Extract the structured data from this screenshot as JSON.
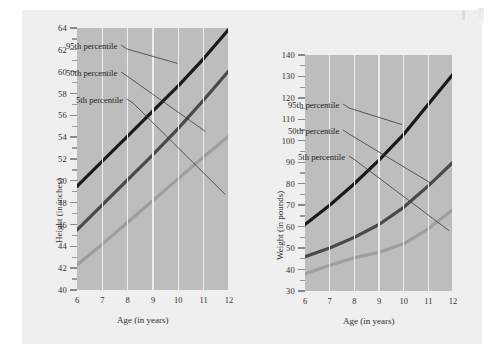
{
  "page": {
    "background": "#ffffff",
    "card_background": "#efefef",
    "plot_background": "#bdbdbd",
    "gridline_color": "#ededed"
  },
  "colors": {
    "p95": "#1a1a1a",
    "p50": "#4a4a4a",
    "p05": "#9e9e9e",
    "text": "#2f2c2a"
  },
  "charts": [
    {
      "id": "height-chart",
      "chart_data": {
        "type": "line",
        "title": "",
        "xlabel": "Age (in years)",
        "ylabel": "Height (in inches)",
        "x": [
          6,
          7,
          8,
          9,
          10,
          11,
          12
        ],
        "xlim": [
          6,
          12
        ],
        "ylim": [
          40,
          64
        ],
        "xticks": [
          "6",
          "7",
          "8",
          "9",
          "10",
          "11",
          "12"
        ],
        "yticks": [
          "40",
          "42",
          "44",
          "46",
          "48",
          "50",
          "52",
          "54",
          "56",
          "58",
          "60",
          "62",
          "64"
        ],
        "grid": true,
        "legend": "inline-annotations",
        "series": [
          {
            "name": "95th percentile",
            "color": "#1a1a1a",
            "values": [
              49.5,
              51.8,
              54.1,
              56.4,
              58.7,
              61.2,
              63.9
            ]
          },
          {
            "name": "50th percentile",
            "color": "#4a4a4a",
            "values": [
              45.5,
              47.8,
              50.1,
              52.4,
              54.8,
              57.4,
              60.1
            ]
          },
          {
            "name": "5th percentile",
            "color": "#9e9e9e",
            "values": [
              42.3,
              44.2,
              46.2,
              48.2,
              50.2,
              52.2,
              54.1
            ]
          }
        ]
      }
    },
    {
      "id": "weight-chart",
      "chart_data": {
        "type": "line",
        "title": "",
        "xlabel": "Age (in years)",
        "ylabel": "Weight (in pounds)",
        "x": [
          6,
          7,
          8,
          9,
          10,
          11,
          12
        ],
        "xlim": [
          6,
          12
        ],
        "ylim": [
          30,
          140
        ],
        "xticks": [
          "6",
          "7",
          "8",
          "9",
          "10",
          "11",
          "12"
        ],
        "yticks": [
          "30",
          "40",
          "50",
          "60",
          "70",
          "80",
          "90",
          "100",
          "110",
          "120",
          "130",
          "140"
        ],
        "grid": true,
        "legend": "inline-annotations",
        "series": [
          {
            "name": "95th percentile",
            "color": "#1a1a1a",
            "values": [
              61,
              70,
              80,
              91,
              103,
              117,
              131
            ]
          },
          {
            "name": "50th percentile",
            "color": "#4a4a4a",
            "values": [
              46,
              50,
              55,
              61,
              69,
              79,
              90
            ]
          },
          {
            "name": "5th percentile",
            "color": "#9e9e9e",
            "values": [
              38,
              42,
              45.5,
              48,
              52,
              59,
              68
            ]
          }
        ]
      }
    }
  ]
}
